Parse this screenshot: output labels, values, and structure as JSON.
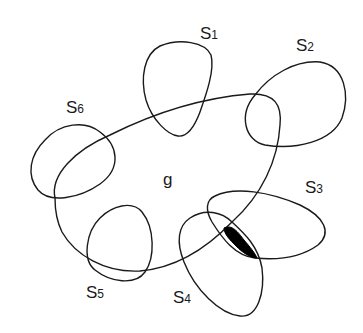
{
  "diagram": {
    "center_set": {
      "label": "g"
    },
    "satellites": [
      {
        "id": "S1",
        "base": "S",
        "sub": "1"
      },
      {
        "id": "S2",
        "base": "S",
        "sub": "2"
      },
      {
        "id": "S3",
        "base": "S",
        "sub": "3"
      },
      {
        "id": "S4",
        "base": "S",
        "sub": "4"
      },
      {
        "id": "S5",
        "base": "S",
        "sub": "5"
      },
      {
        "id": "S6",
        "base": "S",
        "sub": "6"
      }
    ],
    "highlighted_region": "S3 ∩ S4 ∩ g boundary (filled black)",
    "colors": {
      "stroke": "#1a1a1a",
      "fill_highlight": "#000000",
      "background": "#ffffff"
    }
  }
}
